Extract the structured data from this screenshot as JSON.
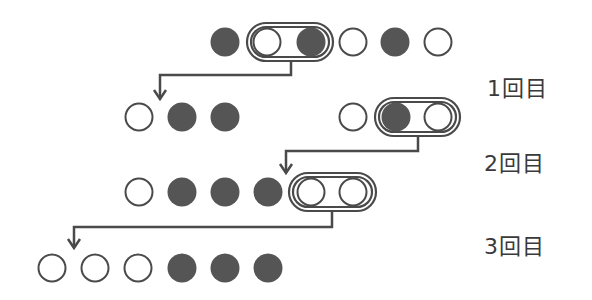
{
  "colors": {
    "stroke": "#4a4a4a",
    "filled": "#555555",
    "empty": "#ffffff",
    "text": "#3a3a3a"
  },
  "labels": [
    {
      "text": "1回目",
      "x": 487,
      "y": 70
    },
    {
      "text": "2回目",
      "x": 484,
      "y": 145
    },
    {
      "text": "3回目",
      "x": 484,
      "y": 228
    }
  ],
  "rows": [
    {
      "y": 42,
      "circles": [
        {
          "x": 225,
          "filled": true
        },
        {
          "x": 267,
          "filled": false
        },
        {
          "x": 311,
          "filled": true
        },
        {
          "x": 353,
          "filled": false
        },
        {
          "x": 395,
          "filled": true
        },
        {
          "x": 438,
          "filled": false
        }
      ],
      "capsule": {
        "x1": 247,
        "x2": 333
      }
    },
    {
      "y": 117,
      "circles": [
        {
          "x": 139,
          "filled": false
        },
        {
          "x": 182,
          "filled": true
        },
        {
          "x": 225,
          "filled": true
        },
        {
          "x": 353,
          "filled": false
        },
        {
          "x": 396,
          "filled": true
        },
        {
          "x": 438,
          "filled": false
        }
      ],
      "capsule": {
        "x1": 375,
        "x2": 460
      }
    },
    {
      "y": 192,
      "circles": [
        {
          "x": 139,
          "filled": false
        },
        {
          "x": 182,
          "filled": true
        },
        {
          "x": 225,
          "filled": true
        },
        {
          "x": 268,
          "filled": true
        },
        {
          "x": 311,
          "filled": false
        },
        {
          "x": 353,
          "filled": false
        }
      ],
      "capsule": {
        "x1": 289,
        "x2": 376
      }
    },
    {
      "y": 268,
      "circles": [
        {
          "x": 52,
          "filled": false
        },
        {
          "x": 95,
          "filled": false
        },
        {
          "x": 138,
          "filled": false
        },
        {
          "x": 182,
          "filled": true
        },
        {
          "x": 225,
          "filled": true
        },
        {
          "x": 268,
          "filled": true
        }
      ],
      "capsule": null
    }
  ],
  "arrows": [
    {
      "from_x": 291,
      "from_y": 61,
      "mid_y": 75,
      "to_x": 160,
      "to_y": 99
    },
    {
      "from_x": 418,
      "from_y": 136,
      "mid_y": 151,
      "to_x": 286,
      "to_y": 173
    },
    {
      "from_x": 332,
      "from_y": 211,
      "mid_y": 227,
      "to_x": 74,
      "to_y": 248
    }
  ]
}
